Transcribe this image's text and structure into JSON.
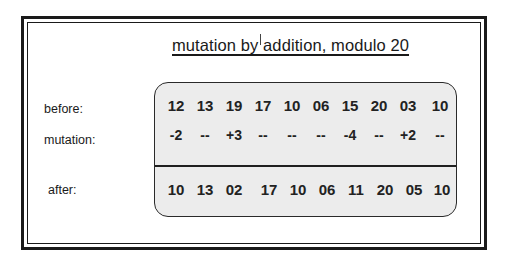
{
  "title": "mutation by addition, modulo 20",
  "labels": {
    "before": "before:",
    "mutation": "mutation:",
    "after": "after:"
  },
  "rows": {
    "before": [
      "12",
      "13",
      "19",
      "17",
      "10",
      "06",
      "15",
      "20",
      "03",
      "10"
    ],
    "mutation": [
      "-2",
      "--",
      "+3",
      "--",
      "--",
      "--",
      "-4",
      "--",
      "+2",
      "--"
    ],
    "after": [
      "10",
      "13",
      "02",
      "17",
      "10",
      "06",
      "11",
      "20",
      "05",
      "10"
    ]
  },
  "colors": {
    "box_fill": "#ececec",
    "border": "#1a1a1a",
    "text": "#1a1a1a"
  }
}
